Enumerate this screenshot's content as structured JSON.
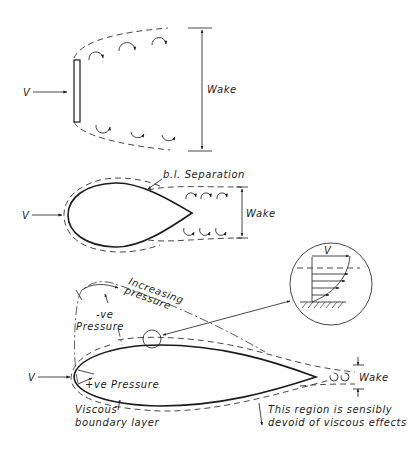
{
  "diagram": {
    "panels": [
      {
        "id": "flat-plate",
        "description": "Flow past a flat plate normal to the stream",
        "labels": {
          "velocity": "V",
          "wake": "Wake"
        }
      },
      {
        "id": "bluff-body",
        "description": "Flow past a bluff teardrop body with boundary-layer separation",
        "labels": {
          "velocity": "V",
          "separation": "b.l. Separation",
          "wake": "Wake"
        }
      },
      {
        "id": "streamlined-body",
        "description": "Flow past a streamlined aerofoil body",
        "labels": {
          "velocity": "V",
          "increasing_pressure_1": "Increasing",
          "increasing_pressure_2": "pressure",
          "neg_pressure_top_1": "-ve",
          "neg_pressure_top_2": "Pressure",
          "pos_pressure_front": "+ve  Pressure",
          "viscous_bl_1": "Viscous",
          "viscous_bl_2": "boundary layer",
          "inviscid_region_1": "This region is sensibly",
          "inviscid_region_2": "devoid of viscous effects",
          "wake": "Wake",
          "inset_velocity": "V"
        }
      }
    ],
    "colors": {
      "line": "#1a1a1a",
      "background": "#ffffff"
    }
  }
}
